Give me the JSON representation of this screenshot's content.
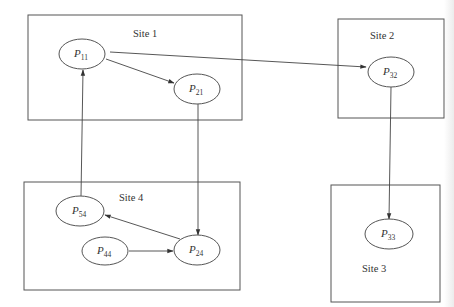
{
  "diagram": {
    "type": "distributed wait-for graph",
    "sites": [
      {
        "id": "site1",
        "label": "Site 1",
        "box": [
          28,
          15,
          242,
          120
        ],
        "label_pos": [
          133,
          37
        ]
      },
      {
        "id": "site2",
        "label": "Site 2",
        "box": [
          338,
          19,
          444,
          118
        ],
        "label_pos": [
          370,
          39
        ]
      },
      {
        "id": "site3",
        "label": "Site 3",
        "box": [
          331,
          185,
          440,
          302
        ],
        "label_pos": [
          362,
          272
        ]
      },
      {
        "id": "site4",
        "label": "Site 4",
        "box": [
          24,
          182,
          240,
          290
        ],
        "label_pos": [
          119,
          201
        ]
      }
    ],
    "nodes": [
      {
        "id": "P11",
        "label": "P",
        "sub": "11",
        "cx": 82,
        "cy": 54,
        "rx": 23,
        "ry": 15
      },
      {
        "id": "P21",
        "label": "P",
        "sub": "21",
        "cx": 197,
        "cy": 89,
        "rx": 23,
        "ry": 15
      },
      {
        "id": "P32",
        "label": "P",
        "sub": "32",
        "cx": 391,
        "cy": 72,
        "rx": 23,
        "ry": 15
      },
      {
        "id": "P33",
        "label": "P",
        "sub": "33",
        "cx": 389,
        "cy": 234,
        "rx": 24,
        "ry": 15
      },
      {
        "id": "P54",
        "label": "P",
        "sub": "54",
        "cx": 80,
        "cy": 211,
        "rx": 24,
        "ry": 15
      },
      {
        "id": "P44",
        "label": "P",
        "sub": "44",
        "cx": 105,
        "cy": 251,
        "rx": 23,
        "ry": 14
      },
      {
        "id": "P24",
        "label": "P",
        "sub": "24",
        "cx": 197,
        "cy": 250,
        "rx": 23,
        "ry": 15
      }
    ],
    "edges": [
      {
        "from": "P11",
        "to": "P21",
        "points": [
          [
            106,
            59
          ],
          [
            174,
            83
          ]
        ]
      },
      {
        "from": "P11",
        "to": "P32",
        "points": [
          [
            110,
            52
          ],
          [
            366,
            67
          ]
        ]
      },
      {
        "from": "P21",
        "to": "P24",
        "points": [
          [
            198,
            104
          ],
          [
            198,
            235
          ]
        ]
      },
      {
        "from": "P32",
        "to": "P33",
        "points": [
          [
            391,
            87
          ],
          [
            389,
            219
          ]
        ]
      },
      {
        "from": "P24",
        "to": "P54",
        "points": [
          [
            180,
            239
          ],
          [
            105,
            215
          ]
        ]
      },
      {
        "from": "P44",
        "to": "P24",
        "points": [
          [
            129,
            251
          ],
          [
            173,
            251
          ]
        ]
      },
      {
        "from": "P54",
        "to": "P11",
        "points": [
          [
            81,
            196
          ],
          [
            83,
            70
          ]
        ]
      }
    ]
  }
}
